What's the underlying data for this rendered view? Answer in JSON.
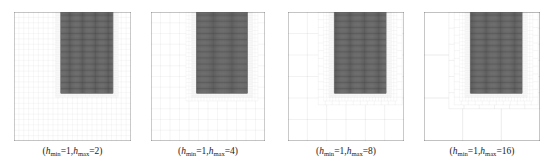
{
  "figure": {
    "type": "mesh-refinement-diagram",
    "background_color": "#ffffff",
    "panel_count": 4,
    "domain_box_color": "#555555",
    "fine_grid_color": "#8c8c8c",
    "refined_fill_color": "#3a3a3a"
  },
  "chart_data": {
    "type": "diagram",
    "title": "",
    "panels": [
      {
        "index": 0,
        "caption_prefix": "(",
        "caption_suffix": ")",
        "h_min_symbol": "h",
        "h_min_sub": "min",
        "h_min_value": "1",
        "h_max_symbol": "h",
        "h_max_sub": "max",
        "h_max_value": "2",
        "caption_plain": "(hmin=1,hmax=2)",
        "base_divisions": 24,
        "refine_bands": 1,
        "fine_divisions": 48,
        "box_x": 14,
        "box_y": 12,
        "box_w": 117,
        "box_h": 129,
        "region_x0": 0.4,
        "region_x1": 0.845,
        "region_y0": 0.0,
        "region_y1": 0.63
      },
      {
        "index": 1,
        "caption_prefix": "(",
        "caption_suffix": ")",
        "h_min_symbol": "h",
        "h_min_sub": "min",
        "h_min_value": "1",
        "h_max_symbol": "h",
        "h_max_sub": "max",
        "h_max_value": "4",
        "caption_plain": "(hmin=1,hmax=4)",
        "base_divisions": 12,
        "refine_bands": 2,
        "fine_divisions": 48,
        "box_x": 151,
        "box_y": 12,
        "box_w": 114,
        "box_h": 129,
        "region_x0": 0.4,
        "region_x1": 0.845,
        "region_y0": 0.0,
        "region_y1": 0.63
      },
      {
        "index": 2,
        "caption_prefix": "(",
        "caption_suffix": ")",
        "h_min_symbol": "h",
        "h_min_sub": "min",
        "h_min_value": "1",
        "h_max_symbol": "h",
        "h_max_sub": "max",
        "h_max_value": "8",
        "caption_plain": "(hmin=1,hmax=8)",
        "base_divisions": 6,
        "refine_bands": 3,
        "fine_divisions": 48,
        "box_x": 288,
        "box_y": 12,
        "box_w": 116,
        "box_h": 129,
        "region_x0": 0.4,
        "region_x1": 0.845,
        "region_y0": 0.0,
        "region_y1": 0.63
      },
      {
        "index": 3,
        "caption_prefix": "(",
        "caption_suffix": ")",
        "h_min_symbol": "h",
        "h_min_sub": "min",
        "h_min_value": "1",
        "h_max_symbol": "h",
        "h_max_sub": "max",
        "h_max_value": "16",
        "caption_plain": "(hmin=1,hmax=16)",
        "base_divisions": 3,
        "refine_bands": 4,
        "fine_divisions": 48,
        "box_x": 424,
        "box_y": 12,
        "box_w": 116,
        "box_h": 129,
        "region_x0": 0.4,
        "region_x1": 0.845,
        "region_y0": 0.0,
        "region_y1": 0.63
      }
    ]
  }
}
